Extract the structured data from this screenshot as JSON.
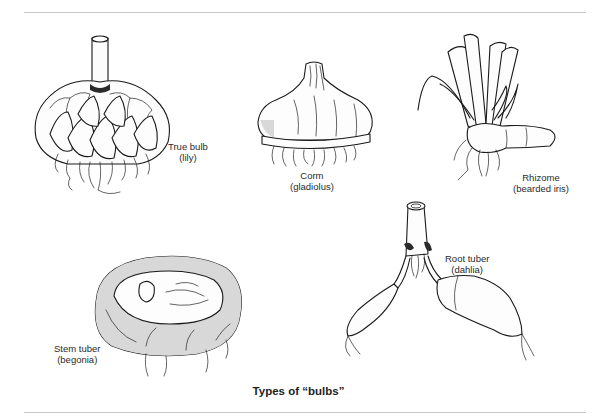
{
  "figure": {
    "caption": "Types of “bulbs”",
    "items": [
      {
        "id": "true-bulb",
        "name": "True bulb",
        "example": "(lily)"
      },
      {
        "id": "corm",
        "name": "Corm",
        "example": "(gladiolus)"
      },
      {
        "id": "rhizome",
        "name": "Rhizome",
        "example": "(bearded iris)"
      },
      {
        "id": "stem-tuber",
        "name": "Stem tuber",
        "example": "(begonia)"
      },
      {
        "id": "root-tuber",
        "name": "Root tuber",
        "example": "(dahlia)"
      }
    ]
  },
  "colors": {
    "ink": "#1a1a1a",
    "rule": "#c9c9c9",
    "background": "#ffffff"
  }
}
